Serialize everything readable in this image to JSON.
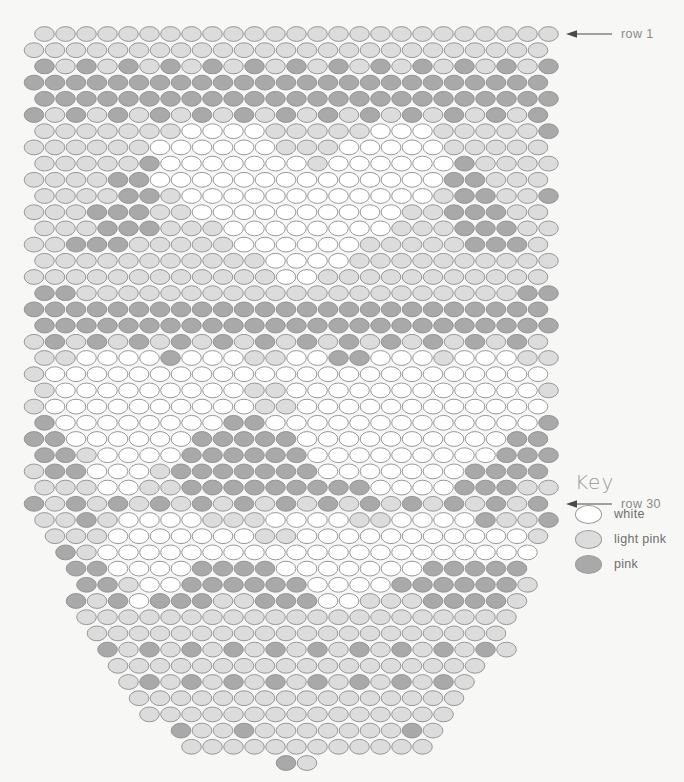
{
  "canvas": {
    "width": 684,
    "height": 782,
    "background": "#f7f7f5"
  },
  "chart_data": {
    "type": "heatmap",
    "title": "",
    "bead_shape": "ellipse",
    "bead_width": 21,
    "bead_height": 16.2,
    "row_pitch": 16.2,
    "origin_x": 34,
    "origin_y": 34,
    "row_offset_odd": 0,
    "row_offset_even": -10.5,
    "total_rows": 46,
    "colors": {
      "white": "#ffffff",
      "light pink": "#dcdcdc",
      "pink": "#a9a9a9",
      "outline": "#8d8d8d"
    },
    "color_keys": [
      "w",
      "l",
      "p"
    ],
    "color_map": {
      "w": "white",
      "l": "light pink",
      "p": "pink"
    },
    "rows": [
      "lllllllllllllllllllllllll",
      "llllllllllllllllllllllllll",
      "plplplplplplplplplplplplp",
      "pppppppppppppppppppppppppp",
      "ppppppppppppppppppppppppp",
      "plplplplplplplplplplplplpl",
      "lllllllwwwwlllllwwwlllllp",
      "llllllwwwwwwlllwwwwwllllll",
      "lllllpwwwwwwwlwwwwwwpllll",
      "llllppwwwwwwwwwwwwwwppllll",
      "llllpplwwwwwwwwwwwwlppllp",
      "lllpppllwwwwwwwwwwllpppllp",
      "lllppplllwwwwwwwwlllppplll",
      "llppplllllwwwwwwlllllpppll",
      "lllllllllllwwwwlllllllllll",
      "llllllllllllwwllllllllllll",
      "pplllllllllllllllllllllpp",
      "pppppppppppppppppppppppppp",
      "ppppppppppppppppppppppppp",
      "lplplplplplplplplplplplplp",
      "llwwwwpwwwllwwppwwwlwwwll",
      "lwwwwwwwwwwwwwwwwwwwwwwwwl",
      "lwwwwwwwwwllwwwwwwwwwwwwl",
      "lwwwwwwwwwwllwwwwwwwwwwwwl",
      "pwwwwwwwwppwwwwwwwwwwwwwp",
      "ppwwwwwwpppppwwwwwwwwwwppp",
      "pplwwwwppppppwwwwwwwwwppp",
      "lppwwwlpppppppwwwwwwwppppl",
      "lllwwllpppppppppwwwwpppll",
      "plplplplplplplplplplplplpl",
      "llplwwwwlllwwwwllwwwwpllp",
      "lllwwwwwwwllwwwwwwwwwwwl",
      "plwwwwwwwwwwwwwwwwwwwww",
      "ppwwwwppppwwwwwwwppppp",
      "pplwwppppppwwwwppppppl",
      "plpwpppllpppwwlllppppl",
      "lllllllllllllllllllll",
      "llllllllllllllllllll",
      "plplplplplplplplplpl",
      "llllllllllllllllll",
      "lplplplplplplplpl",
      "llllllllllllllll",
      "lllllllllllllll",
      "pllplllllllpl",
      "llllllllllll",
      "pl"
    ]
  },
  "markers": [
    {
      "id": "row1",
      "label": "row 1",
      "row_index": 1
    },
    {
      "id": "row30",
      "label": "row 30",
      "row_index": 30
    }
  ],
  "key": {
    "title": "Key",
    "items": [
      {
        "label": "white",
        "color": "#ffffff"
      },
      {
        "label": "light pink",
        "color": "#dcdcdc"
      },
      {
        "label": "pink",
        "color": "#a9a9a9"
      }
    ]
  }
}
